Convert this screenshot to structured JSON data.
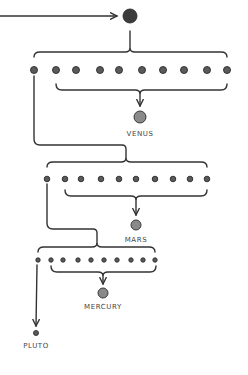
{
  "diagram": {
    "type": "hierarchical-split",
    "colors": {
      "ink": "#2b2b2b",
      "dot_fill": "#5a5a5a",
      "planet_fill": "#8a8a8a",
      "line": "#333333"
    },
    "source": {
      "x": 130,
      "y": 16,
      "r": 7
    },
    "incoming_arrow": {
      "x1": 0,
      "y1": 16,
      "x2": 117,
      "y2": 16
    },
    "levels": [
      {
        "id": "level-1",
        "top_bracket": {
          "x1": 34,
          "x2": 227,
          "y": 52,
          "cusp_x": 130,
          "from_y": 31
        },
        "dots": {
          "y": 70,
          "r": 3.5,
          "xs": [
            34,
            56,
            76,
            100,
            119,
            142,
            163,
            184,
            207,
            227
          ]
        },
        "merge_bracket": {
          "x1": 56,
          "x2": 227,
          "y": 90,
          "cusp_x": 140,
          "arrow_to_y": 106
        },
        "planet": {
          "name": "VENUS",
          "x": 140,
          "y": 117,
          "r": 6,
          "label_y": 130
        }
      },
      {
        "id": "level-2",
        "carry_line": {
          "from_x": 34,
          "from_y": 76,
          "down_to_y": 145,
          "to_x": 126,
          "bracket_y": 160
        },
        "top_bracket": {
          "x1": 47,
          "x2": 207,
          "y": 162,
          "cusp_x": 126
        },
        "dots": {
          "y": 179,
          "r": 2.8,
          "xs": [
            47,
            65,
            81,
            101,
            119,
            136,
            155,
            173,
            190,
            207
          ]
        },
        "merge_bracket": {
          "x1": 65,
          "x2": 207,
          "y": 196,
          "cusp_x": 136,
          "arrow_to_y": 215
        },
        "planet": {
          "name": "MARS",
          "x": 136,
          "y": 225,
          "r": 5,
          "label_y": 236
        }
      },
      {
        "id": "level-3",
        "carry_line": {
          "from_x": 47,
          "from_y": 184,
          "down_to_y": 229,
          "to_x": 97,
          "bracket_y": 244
        },
        "top_bracket": {
          "x1": 38,
          "x2": 155,
          "y": 247,
          "cusp_x": 97
        },
        "dots": {
          "y": 260,
          "r": 2.2,
          "xs": [
            38,
            51,
            63,
            78,
            91,
            104,
            117,
            131,
            143,
            155
          ]
        },
        "merge_bracket": {
          "x1": 51,
          "x2": 156,
          "y": 272,
          "cusp_x": 103,
          "arrow_to_y": 284
        },
        "planet": {
          "name": "MERCURY",
          "x": 103,
          "y": 293,
          "r": 5,
          "label_y": 303
        }
      }
    ],
    "remainder": {
      "name": "PLUTO",
      "arrow": {
        "x1": 37,
        "y1": 265,
        "x2": 36,
        "y2": 326
      },
      "x": 36,
      "y": 333,
      "r": 2.5,
      "label_y": 342
    }
  },
  "labels": {
    "venus": "VENUS",
    "mars": "MARS",
    "mercury": "MERCURY",
    "pluto": "PLUTO"
  }
}
